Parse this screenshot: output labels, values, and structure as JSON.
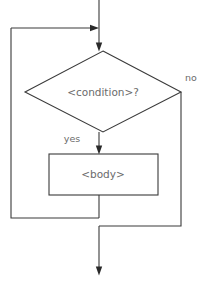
{
  "diagram": {
    "kind": "flowchart",
    "canvas": {
      "width": 206,
      "height": 285,
      "background": "#ffffff"
    },
    "style": {
      "line_color": "#3a3a3a",
      "text_color": "#6b6b6b",
      "arrow_color": "#2a2a2a",
      "shape_fill": "#ffffff",
      "line_width": 1.1
    },
    "nodes": {
      "condition": {
        "shape": "diamond",
        "label": "<condition>?",
        "left_x": 25,
        "right_x": 181,
        "top_y": 51,
        "bottom_y": 132,
        "center_x": 103,
        "center_y": 92
      },
      "body": {
        "shape": "rectangle",
        "label": "<body>",
        "x": 49,
        "y": 154,
        "width": 109,
        "height": 41,
        "center_x": 103,
        "center_y": 174
      }
    },
    "edge_labels": {
      "yes": {
        "text": "yes",
        "x": 72,
        "y": 139
      },
      "no": {
        "text": "no",
        "x": 185,
        "y": 78
      }
    },
    "edges": [
      {
        "name": "entry-into-condition",
        "path": "M 99 0 L 99 51",
        "arrow_at": {
          "x": 99,
          "y": 51,
          "direction": "down"
        }
      },
      {
        "name": "loopback-rail-into-entry",
        "path": "M 99 28 L 11 28 L 11 218 L 99 218",
        "arrow_at": {
          "x": 99,
          "y": 28,
          "direction": "right"
        }
      },
      {
        "name": "condition-yes-to-body",
        "path": "M 99 132 L 99 154",
        "arrow_at": {
          "x": 99,
          "y": 154,
          "direction": "down"
        }
      },
      {
        "name": "body-to-loopback",
        "path": "M 99 195 L 99 218"
      },
      {
        "name": "condition-no-to-exit",
        "path": "M 181 92 L 181 226 L 99 226"
      },
      {
        "name": "exit-arrow",
        "path": "M 99 226 L 99 275",
        "arrow_at": {
          "x": 99,
          "y": 275,
          "direction": "down"
        }
      }
    ]
  }
}
